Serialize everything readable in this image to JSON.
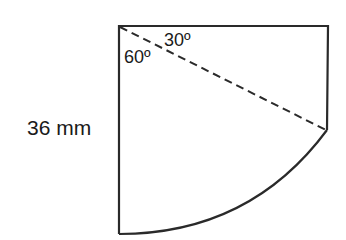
{
  "diagram": {
    "type": "geometry-figure",
    "labels": {
      "side_length": "36 mm",
      "angle_upper": "30º",
      "angle_lower": "60º"
    },
    "colors": {
      "stroke": "#2a2a2a",
      "text": "#1a1a1a",
      "background": "#ffffff"
    }
  }
}
